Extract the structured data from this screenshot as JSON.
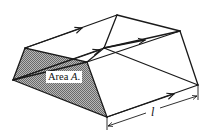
{
  "figure": {
    "type": "flux-tube-diagram",
    "labels": {
      "area_prefix": "Area ",
      "area_symbol": "A",
      "area_suffix": ".",
      "length_symbol": "l"
    },
    "colors": {
      "line": "#1a1a1a",
      "hatch": "#8a8a8a",
      "background": "#ffffff"
    },
    "vertices": {
      "front_left": [
        13,
        80
      ],
      "front_top_left": [
        25,
        48
      ],
      "front_top_right": [
        87,
        62
      ],
      "front_bottom": [
        107,
        117
      ],
      "back_left_top": [
        104,
        48
      ],
      "back_apex": [
        117,
        15
      ],
      "back_right_top": [
        180,
        31
      ],
      "back_right_bottom": [
        198,
        85
      ]
    }
  }
}
